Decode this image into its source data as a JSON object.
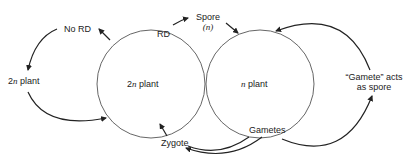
{
  "diagram": {
    "left_circle": {
      "label_prefix": "2",
      "label_italic": "n",
      "label_suffix": " plant"
    },
    "right_circle": {
      "label_italic": "n",
      "label_suffix": " plant"
    },
    "labels": {
      "no_rd": "No RD",
      "rd": "RD",
      "spore": "Spore",
      "spore_ploidy": "(n)",
      "outer_plant_prefix": "2",
      "outer_plant_italic": "n",
      "outer_plant_suffix": " plant",
      "zygote": "Zygote",
      "gametes": "Gametes",
      "gamete_spore_line1": "“Gamete” acts",
      "gamete_spore_line2": "as spore"
    },
    "colors": {
      "stroke": "#222222",
      "circle": "#555555",
      "text": "#222222"
    }
  }
}
